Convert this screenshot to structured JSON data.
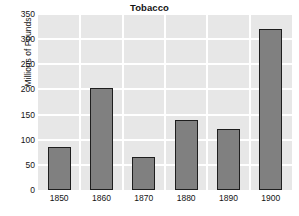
{
  "chart_data": {
    "type": "bar",
    "title": "Tobacco",
    "xlabel": "",
    "ylabel": "Millions of Pounds",
    "categories": [
      "1850",
      "1860",
      "1870",
      "1880",
      "1890",
      "1900"
    ],
    "values": [
      85,
      202,
      66,
      140,
      122,
      321
    ],
    "ylim": [
      0,
      350
    ],
    "yticks": [
      0,
      50,
      100,
      150,
      200,
      250,
      300,
      350
    ],
    "ytick_labels": [
      "0",
      "50",
      "100",
      "150",
      "200",
      "250",
      "300",
      "350"
    ],
    "grid": true,
    "legend": null,
    "colors": {
      "bar_fill": "#808080",
      "bar_edge": "#1e1e1e",
      "plot_background": "#e7e7e7",
      "gridline": "#ffffff",
      "figure_background": "#ffffff",
      "text": "#141414"
    }
  }
}
